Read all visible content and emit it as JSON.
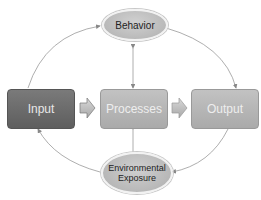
{
  "diagram": {
    "nodes": {
      "behavior": {
        "label": "Behavior"
      },
      "input": {
        "label": "Input"
      },
      "processes": {
        "label": "Processes"
      },
      "output": {
        "label": "Output"
      },
      "environmental_exposure": {
        "label": "Environmental Exposure",
        "line1": "Environmental",
        "line2": "Exposure"
      }
    },
    "edges": [
      {
        "from": "input",
        "to": "behavior",
        "type": "curved-arrow"
      },
      {
        "from": "behavior",
        "to": "output",
        "type": "curved-arrow"
      },
      {
        "from": "output",
        "to": "environmental_exposure",
        "type": "curved-arrow"
      },
      {
        "from": "environmental_exposure",
        "to": "input",
        "type": "curved-arrow"
      },
      {
        "from": "behavior",
        "to": "processes",
        "type": "bidirectional-line"
      },
      {
        "from": "environmental_exposure",
        "to": "processes",
        "type": "bidirectional-line"
      },
      {
        "from": "input",
        "to": "processes",
        "type": "block-arrow"
      },
      {
        "from": "processes",
        "to": "output",
        "type": "block-arrow"
      }
    ],
    "colors": {
      "input_fill": "#6b6b6b",
      "processes_fill": "#b8b8b8",
      "output_fill": "#b8b8b8",
      "ellipse_fill": "#c4c4c4",
      "line": "#888888"
    }
  }
}
